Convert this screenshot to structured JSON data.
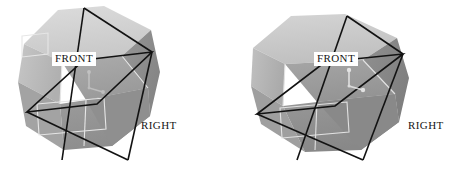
{
  "figure": {
    "kind": "3d-cube-orientation-pair",
    "background_color": "#ffffff",
    "width": 453,
    "height": 175,
    "panel_count": 2
  },
  "palette": {
    "page_background": "#ffffff",
    "face_top": "#d2d2d2",
    "face_top_alt": "#c6c6c6",
    "face_left": "#b4b4b4",
    "face_left_alt": "#a8a8a8",
    "face_front": "#9d9d9d",
    "face_right": "#8f8f8f",
    "face_right_dark": "#868686",
    "face_bottom": "#9a9a9a",
    "wire_black": "#111111",
    "wire_light": "#e4e4e4",
    "gizmo_light": "#e8e8e8",
    "label_text": "#151515",
    "label_box": "#ffffff"
  },
  "panels": [
    {
      "id": "panel-left",
      "name": "cube-view-a",
      "labels": {
        "front": {
          "text": "FRONT",
          "boxed": true,
          "x": 52,
          "y": 52
        },
        "right": {
          "text": "RIGHT",
          "boxed": false,
          "x": 141,
          "y": 120
        }
      },
      "gizmo": {
        "name": "axis-gizmo",
        "visible": true,
        "opacity": 0.35,
        "center_x": 93,
        "center_y": 82
      }
    },
    {
      "id": "panel-right",
      "name": "cube-view-b",
      "labels": {
        "front": {
          "text": "FRONT",
          "boxed": true,
          "x": 87,
          "y": 52
        },
        "right": {
          "text": "RIGHT",
          "boxed": false,
          "x": 181,
          "y": 120
        }
      },
      "gizmo": {
        "name": "axis-gizmo",
        "visible": true,
        "opacity": 0.75,
        "center_x": 126,
        "center_y": 80
      }
    }
  ],
  "geometry": {
    "cube_a": {
      "silhouette": "24,44 58,10 104,6 151,30 160,72 150,116 112,146 64,150 26,126 18,82",
      "faces": [
        {
          "name": "top-face",
          "points": "24,44 58,10 104,6 151,30 122,56 62,62",
          "fill": "#d2d2d2"
        },
        {
          "name": "upper-left",
          "points": "18,82 24,44 62,62 60,104",
          "fill": "#bdbdbd"
        },
        {
          "name": "front-face",
          "points": "62,62 122,56 148,88 86,100",
          "fill": "#a4a4a4"
        },
        {
          "name": "right-face",
          "points": "122,56 151,30 160,72 150,116 148,88",
          "fill": "#8f8f8f"
        },
        {
          "name": "lower-left",
          "points": "18,82 60,104 64,150 26,126",
          "fill": "#a2a2a2"
        },
        {
          "name": "bottom-face",
          "points": "60,104 86,100 148,88 150,116 112,146 64,150",
          "fill": "#959595"
        }
      ],
      "black_wire": {
        "front_quad": "27,112 97,104 152,52 84,60",
        "diagonals": [
          "84,8 128,160",
          "27,112 152,52"
        ],
        "x_lines": [
          "84,8 62,160",
          "84,8 152,52"
        ]
      },
      "light_wire_rects": [
        "22,36 48,34 48,54 22,56",
        "36,104 104,98 106,128 38,134"
      ]
    },
    "cube_b": {
      "silhouette": "26,48 64,16 118,14 170,38 182,78 172,122 134,150 78,152 34,124 24,86",
      "faces": [
        {
          "name": "top-face",
          "points": "26,48 64,16 118,14 170,38 136,60 58,64",
          "fill": "#c9c9c9"
        },
        {
          "name": "upper-left",
          "points": "24,86 26,48 58,64 56,106",
          "fill": "#b6b6b6"
        },
        {
          "name": "front-face",
          "points": "58,64 136,60 168,94 90,102",
          "fill": "#9b9b9b"
        },
        {
          "name": "right-face",
          "points": "136,60 170,38 182,78 172,122 168,94",
          "fill": "#8b8b8b"
        },
        {
          "name": "lower-left",
          "points": "24,86 56,106 78,152 34,124",
          "fill": "#9e9e9e"
        },
        {
          "name": "bottom-face",
          "points": "56,106 90,102 168,94 172,122 134,150 78,152",
          "fill": "#909090"
        }
      ],
      "black_wire": {
        "front_quad": "30,114 108,106 176,54 98,62",
        "diagonals": [
          "120,16 136,160",
          "30,114 176,54"
        ],
        "x_lines": [
          "120,16 70,160",
          "120,16 176,54"
        ]
      },
      "light_wire_rects": [
        "52,108 120,102 122,132 54,138"
      ]
    }
  }
}
